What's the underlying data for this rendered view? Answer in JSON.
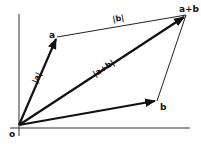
{
  "diagram": {
    "type": "vector-addition-parallelogram",
    "colors": {
      "ink": "#111111",
      "background": "#ffffff"
    },
    "points": {
      "origin": {
        "label": "o",
        "x": 19,
        "y": 125
      },
      "a": {
        "label": "a",
        "x": 57,
        "y": 37
      },
      "b": {
        "label": "b",
        "x": 157,
        "y": 101
      },
      "a_plus_b": {
        "label": "a+b",
        "x": 186,
        "y": 15
      }
    },
    "norm_labels": {
      "a": "|a|",
      "b": "|b|",
      "a_plus_b": "|a+b|"
    },
    "axes": {
      "y_axis": {
        "x": 19,
        "y1": 14,
        "y2": 136
      },
      "x_axis": {
        "y": 128,
        "x1": 10,
        "x2": 190
      }
    }
  }
}
